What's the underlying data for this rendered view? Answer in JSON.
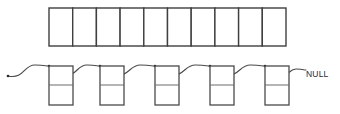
{
  "diagram": {
    "background_color": "#ffffff",
    "line_color": "#4a4a4a",
    "array_border_color": "#3f3f3f",
    "divider_color": "#6a6a6a",
    "dot_color": "#2a2a2a",
    "text_color": "#2b2b2b"
  },
  "array": {
    "name": "bucket-array",
    "cell_count": 10,
    "x": 49,
    "y": 8,
    "cell_width": 23.7,
    "height": 38,
    "cells": [
      {
        "index": 0,
        "value": ""
      },
      {
        "index": 1,
        "value": ""
      },
      {
        "index": 2,
        "value": ""
      },
      {
        "index": 3,
        "value": ""
      },
      {
        "index": 4,
        "value": ""
      },
      {
        "index": 5,
        "value": ""
      },
      {
        "index": 6,
        "value": ""
      },
      {
        "index": 7,
        "value": ""
      },
      {
        "index": 8,
        "value": ""
      },
      {
        "index": 9,
        "value": ""
      }
    ]
  },
  "linked_list": {
    "name": "node-chain",
    "node_count": 5,
    "node_width": 24,
    "node_height": 39,
    "node_top": 66,
    "divider_offset": 19,
    "nodes": [
      {
        "index": 0,
        "x": 49,
        "data": "",
        "next": ""
      },
      {
        "index": 1,
        "x": 100,
        "data": "",
        "next": ""
      },
      {
        "index": 2,
        "x": 155,
        "data": "",
        "next": ""
      },
      {
        "index": 3,
        "x": 210,
        "data": "",
        "next": ""
      },
      {
        "index": 4,
        "x": 265,
        "data": "",
        "next": ""
      }
    ],
    "head_pointer": {
      "start_x": 8,
      "start_y": 76,
      "end_x": 49,
      "end_y": 66
    },
    "terminator": {
      "label": "NULL",
      "x": 306,
      "y": 75
    }
  }
}
